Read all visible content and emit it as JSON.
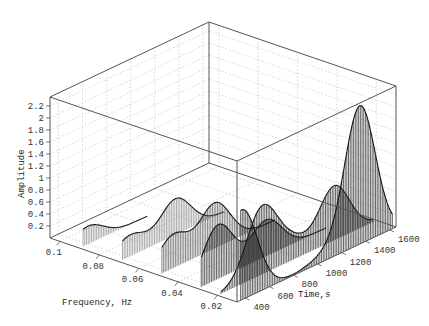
{
  "chart_data": {
    "type": "bar3d-waterfall",
    "title": "",
    "xlabel": "Frequency, Hz",
    "ylabel": "Time,s",
    "zlabel": "Amplitude",
    "x_ticks": [
      "0.1",
      "0.08",
      "0.06",
      "0.04",
      "0.02"
    ],
    "x_tick_values": [
      0.1,
      0.08,
      0.06,
      0.04,
      0.02
    ],
    "y_ticks": [
      "400",
      "600",
      "800",
      "1000",
      "1200",
      "1400",
      "1600"
    ],
    "y_tick_values": [
      400,
      600,
      800,
      1000,
      1200,
      1400,
      1600
    ],
    "z_ticks": [
      "0.2",
      "0.4",
      "0.6",
      "0.8",
      "1",
      "1.2",
      "1.4",
      "1.6",
      "1.8",
      "2",
      "2.2"
    ],
    "z_tick_values": [
      0.2,
      0.4,
      0.6,
      0.8,
      1.0,
      1.2,
      1.4,
      1.6,
      1.8,
      2.0,
      2.2
    ],
    "xlim": [
      0.01,
      0.105
    ],
    "ylim": [
      330,
      1650
    ],
    "zlim": [
      0,
      2.35
    ],
    "grid": true,
    "legend": null,
    "series": [
      {
        "name": "f=0.01 Hz",
        "frequency": 0.01,
        "time_start": 360,
        "time_end": 1620,
        "peaks": [
          {
            "time": 370,
            "amp": 1.5
          },
          {
            "time": 1050,
            "amp": 0.1
          },
          {
            "time": 1350,
            "amp": 2.3
          }
        ],
        "shape": "slow rise to main peak ~2.3 near t=1350"
      },
      {
        "name": "f=0.02 Hz",
        "frequency": 0.02,
        "time_start": 360,
        "time_end": 1620,
        "peaks": [
          {
            "time": 700,
            "amp": 1.1
          },
          {
            "time": 950,
            "amp": 0.3
          },
          {
            "time": 1300,
            "amp": 0.9
          }
        ],
        "shape": "oscillating ribbon"
      },
      {
        "name": "f=0.03 Hz",
        "frequency": 0.03,
        "time_start": 360,
        "time_end": 1400,
        "peaks": [
          {
            "time": 500,
            "amp": 0.9
          },
          {
            "time": 900,
            "amp": 0.6
          }
        ],
        "shape": "ribbon"
      },
      {
        "name": "f=0.05 Hz",
        "frequency": 0.05,
        "time_start": 360,
        "time_end": 1300,
        "peaks": [
          {
            "time": 450,
            "amp": 0.55
          },
          {
            "time": 800,
            "amp": 0.75
          }
        ],
        "shape": "curling ribbon"
      },
      {
        "name": "f=0.07 Hz",
        "frequency": 0.07,
        "time_start": 360,
        "time_end": 1200,
        "peaks": [
          {
            "time": 420,
            "amp": 0.35
          },
          {
            "time": 800,
            "amp": 0.6
          }
        ],
        "shape": "curling ribbon"
      },
      {
        "name": "f=0.09 Hz",
        "frequency": 0.09,
        "time_start": 360,
        "time_end": 900,
        "peaks": [
          {
            "time": 400,
            "amp": 0.3
          }
        ],
        "shape": "low ribbon"
      }
    ]
  },
  "labels": {
    "z_axis": "Amplitude",
    "x_axis": "Frequency, Hz",
    "y_axis": "Time,s"
  },
  "colors": {
    "box": "#555555",
    "grid": "#bbbbbb",
    "stem": "#333333",
    "text": "#333333"
  }
}
